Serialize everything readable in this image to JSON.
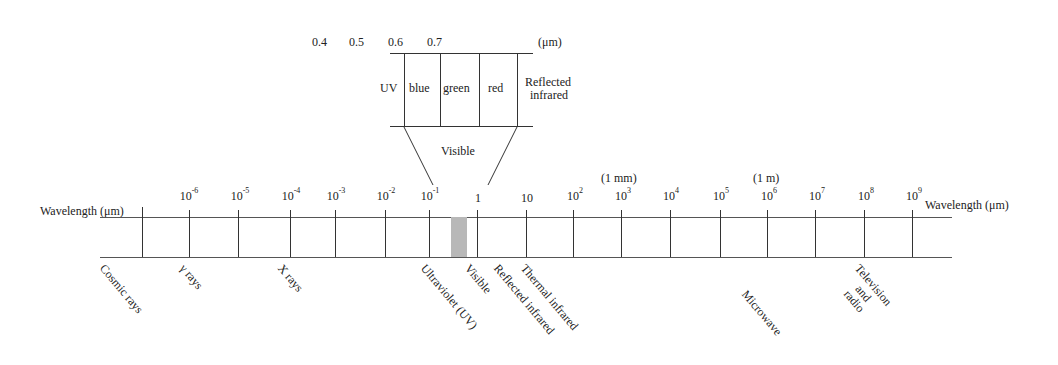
{
  "inset": {
    "wavelength_ticks": [
      "0.4",
      "0.5",
      "0.6",
      "0.7"
    ],
    "unit": "(μm)",
    "bands": [
      "UV",
      "blue",
      "green",
      "red"
    ],
    "reflected_ir_line1": "Reflected",
    "reflected_ir_line2": "infrared",
    "visible_label": "Visible"
  },
  "axis": {
    "left_label": "Wavelength (μm)",
    "right_label": "Wavelength (μm)",
    "annotations": {
      "mm": "(1 mm)",
      "m": "(1 m)"
    },
    "ticks": [
      {
        "base": "10",
        "exp": "-6"
      },
      {
        "base": "10",
        "exp": "-5"
      },
      {
        "base": "10",
        "exp": "-4"
      },
      {
        "base": "10",
        "exp": "-3"
      },
      {
        "base": "10",
        "exp": "-2"
      },
      {
        "base": "10",
        "exp": "-1"
      },
      {
        "base": "1",
        "exp": ""
      },
      {
        "base": "10",
        "exp": ""
      },
      {
        "base": "10",
        "exp": "2"
      },
      {
        "base": "10",
        "exp": "3"
      },
      {
        "base": "10",
        "exp": "4"
      },
      {
        "base": "10",
        "exp": "5"
      },
      {
        "base": "10",
        "exp": "6"
      },
      {
        "base": "10",
        "exp": "7"
      },
      {
        "base": "10",
        "exp": "8"
      },
      {
        "base": "10",
        "exp": "9"
      }
    ]
  },
  "regions": {
    "cosmic": "Cosmic rays",
    "gamma": "γ rays",
    "xray": "X rays",
    "uv": "Ultraviolet (UV)",
    "visible": "Visible",
    "reflected_ir": "Reflected infrared",
    "thermal_ir": "Thermal infrared",
    "microwave": "Microwave",
    "tv1": "Television",
    "tv2": "and",
    "tv3": "radio"
  },
  "colors": {
    "line": "#333333",
    "visible_shade": "#b8b8b8"
  }
}
